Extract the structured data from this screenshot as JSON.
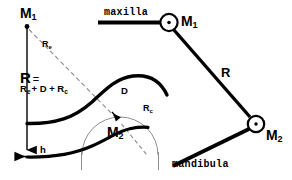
{
  "figure": {
    "background_color": "#ffffff",
    "stroke_color": "#000000",
    "thin_stroke_color": "#6f6f6f",
    "width": 292,
    "height": 180
  },
  "left_panel": {
    "name": "radius-decomposition-detail",
    "labels": {
      "m1": "M",
      "m1_sub": "1",
      "m2": "M",
      "m2_sub": "2",
      "r_big": "R",
      "equals": "=",
      "formula_main": "R",
      "formula_sub_e": "e",
      "formula_plus_d": "+ D + R",
      "formula_sub_c": "c",
      "r_e": "R",
      "r_e_sub": "e",
      "r_c": "R",
      "r_c_sub": "c",
      "d": "D",
      "h": "h"
    }
  },
  "right_panel": {
    "name": "linkage-schematic",
    "labels": {
      "maxilla": "maxilla",
      "mandibula": "mandibula",
      "m1": "M",
      "m1_sub": "1",
      "m2": "M",
      "m2_sub": "2",
      "r": "R"
    }
  },
  "geometry": {
    "left": {
      "m1_point": [
        27,
        26
      ],
      "vertical_axis": [
        [
          27,
          26
        ],
        [
          27,
          157
        ]
      ],
      "h_baseline": [
        [
          11,
          157
        ],
        [
          27,
          157
        ]
      ],
      "dashed_re": [
        [
          29,
          28
        ],
        [
          120,
          122
        ]
      ],
      "dashed_rc": [
        [
          119,
          121
        ],
        [
          100,
          97
        ]
      ],
      "circle_center": [
        120,
        122
      ],
      "circle_radius": 38
    },
    "right": {
      "maxilla_line": [
        [
          98,
          22
        ],
        [
          163,
          22
        ]
      ],
      "m1_joint": [
        169,
        22
      ],
      "m1_joint_radius": 9,
      "m2_joint": [
        256,
        124
      ],
      "m2_joint_radius": 8,
      "r_link": [
        [
          174,
          30
        ],
        [
          251,
          118
        ]
      ],
      "mandibula_line": [
        [
          249,
          129
        ],
        [
          172,
          166
        ]
      ]
    }
  },
  "colors": {
    "ink": "#000000",
    "thin_ink": "#777777",
    "paper": "#ffffff"
  }
}
